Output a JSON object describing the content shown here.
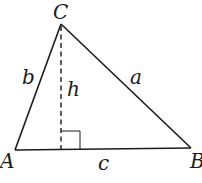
{
  "diagram": {
    "type": "triangle-with-altitude",
    "vertices": {
      "A": {
        "label": "A",
        "x": 15,
        "y": 150
      },
      "B": {
        "label": "B",
        "x": 191,
        "y": 148
      },
      "C": {
        "label": "C",
        "x": 61,
        "y": 24
      }
    },
    "sides": {
      "a": {
        "label": "a",
        "from": "C",
        "to": "B"
      },
      "b": {
        "label": "b",
        "from": "A",
        "to": "C"
      },
      "c": {
        "label": "c",
        "from": "A",
        "to": "B"
      }
    },
    "altitude": {
      "label": "h",
      "from": "C",
      "foot_x": 61,
      "foot_y": 150,
      "style": "dashed"
    },
    "right_angle_marker": {
      "size": 20
    },
    "colors": {
      "stroke": "#1a1a1a",
      "background": "#ffffff"
    }
  }
}
